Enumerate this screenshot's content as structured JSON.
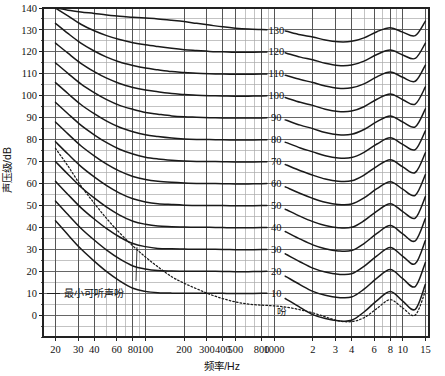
{
  "chart_data": {
    "type": "line",
    "title": "",
    "xlabel": "频率/Hz",
    "ylabel": "声压级/dB",
    "xscale": "log",
    "xlim": [
      16,
      16000
    ],
    "ylim": [
      -10,
      140
    ],
    "grid": true,
    "legend_position": "inline-labels",
    "x_tick_labels": [
      "20",
      "30",
      "40",
      "60",
      "80",
      "100",
      "200",
      "300",
      "400",
      "500",
      "800",
      "1000",
      "2",
      "3",
      "4",
      "6",
      "8",
      "10",
      "15"
    ],
    "x_tick_values": [
      20,
      30,
      40,
      60,
      80,
      100,
      200,
      300,
      400,
      500,
      800,
      1000,
      2000,
      3000,
      4000,
      6000,
      8000,
      10000,
      15000
    ],
    "y_tick_labels": [
      "0",
      "10",
      "20",
      "30",
      "40",
      "50",
      "60",
      "70",
      "80",
      "90",
      "100",
      "110",
      "120",
      "130",
      "140"
    ],
    "y_tick_values": [
      0,
      10,
      20,
      30,
      40,
      50,
      60,
      70,
      80,
      90,
      100,
      110,
      120,
      130,
      140
    ],
    "y_minor_step": 5,
    "annotations": [
      {
        "name": "minimum-audible-field",
        "text": "最小可听声吩",
        "x": 100,
        "y": 10
      },
      {
        "name": "phon-unit",
        "text": "吩",
        "x": 1150,
        "y": 2
      }
    ],
    "series_unit": "吩",
    "series_labels": [
      "130",
      "120",
      "110",
      "100",
      "90",
      "80",
      "70",
      "60",
      "50",
      "40",
      "30",
      "20",
      "10"
    ],
    "x": [
      20,
      25,
      31.5,
      40,
      50,
      63,
      80,
      100,
      125,
      160,
      200,
      250,
      315,
      400,
      500,
      630,
      800,
      1000,
      1250,
      1600,
      2000,
      2500,
      3150,
      4000,
      5000,
      6300,
      8000,
      10000,
      12500,
      15000
    ],
    "series": [
      {
        "name": "130 phon",
        "values": [
          140.0,
          139.0,
          138.2,
          137.5,
          136.8,
          136.2,
          135.8,
          135.4,
          135.0,
          134.4,
          133.8,
          133.0,
          132.2,
          131.4,
          130.8,
          130.4,
          130.2,
          130.0,
          129.4,
          127.8,
          126.8,
          125.4,
          124.6,
          124.8,
          126.4,
          129.2,
          131.0,
          129.0,
          127.4,
          134.0
        ]
      },
      {
        "name": "120 phon",
        "values": [
          140.0,
          136.4,
          132.6,
          129.6,
          127.4,
          125.6,
          124.2,
          123.2,
          122.4,
          121.6,
          121.0,
          120.6,
          120.2,
          120.0,
          119.8,
          119.8,
          119.9,
          120.0,
          119.4,
          117.6,
          116.4,
          114.8,
          113.8,
          114.0,
          115.8,
          118.8,
          120.8,
          118.6,
          117.0,
          124.0
        ]
      },
      {
        "name": "110 phon",
        "values": [
          133.0,
          128.4,
          124.0,
          120.4,
          117.6,
          115.4,
          113.8,
          112.6,
          111.8,
          111.0,
          110.6,
          110.2,
          110.0,
          109.9,
          109.8,
          109.8,
          109.9,
          110.0,
          109.2,
          107.4,
          106.0,
          104.4,
          103.4,
          103.6,
          105.4,
          108.6,
          110.8,
          108.4,
          106.6,
          114.0
        ]
      },
      {
        "name": "100 phon",
        "values": [
          124.0,
          119.4,
          114.8,
          111.0,
          108.0,
          105.6,
          103.8,
          102.6,
          101.8,
          101.0,
          100.6,
          100.2,
          100.0,
          99.9,
          99.8,
          99.8,
          99.9,
          100.0,
          99.0,
          97.0,
          95.6,
          93.8,
          92.8,
          93.0,
          95.0,
          98.4,
          100.8,
          98.2,
          96.2,
          104.0
        ]
      },
      {
        "name": "90 phon",
        "values": [
          115.0,
          110.2,
          105.4,
          101.4,
          98.2,
          95.6,
          93.8,
          92.4,
          91.6,
          90.8,
          90.4,
          90.2,
          90.0,
          89.9,
          89.8,
          89.8,
          89.9,
          90.0,
          88.8,
          86.6,
          85.0,
          83.2,
          82.2,
          82.4,
          84.6,
          88.2,
          90.8,
          88.0,
          85.8,
          94.0
        ]
      },
      {
        "name": "80 phon",
        "values": [
          106.0,
          101.0,
          96.0,
          91.8,
          88.4,
          85.6,
          83.6,
          82.2,
          81.4,
          80.7,
          80.3,
          80.1,
          80.0,
          79.9,
          79.8,
          79.8,
          79.9,
          80.0,
          78.6,
          76.2,
          74.4,
          72.6,
          71.6,
          71.8,
          74.2,
          78.0,
          80.8,
          77.8,
          75.4,
          84.0
        ]
      },
      {
        "name": "70 phon",
        "values": [
          97.0,
          91.8,
          86.6,
          82.2,
          78.6,
          75.6,
          73.4,
          72.0,
          71.2,
          70.6,
          70.2,
          70.0,
          70.0,
          69.9,
          69.8,
          69.8,
          69.9,
          70.0,
          68.4,
          65.8,
          63.8,
          62.0,
          61.0,
          61.2,
          63.8,
          67.8,
          70.8,
          67.6,
          65.0,
          74.0
        ]
      },
      {
        "name": "60 phon",
        "values": [
          88.0,
          82.6,
          77.2,
          72.6,
          68.8,
          65.6,
          63.2,
          61.8,
          61.0,
          60.5,
          60.2,
          60.0,
          60.0,
          59.9,
          59.8,
          59.8,
          59.9,
          60.0,
          58.2,
          55.4,
          53.2,
          51.4,
          50.4,
          50.6,
          53.4,
          57.6,
          60.8,
          57.4,
          54.6,
          64.0
        ]
      },
      {
        "name": "50 phon",
        "values": [
          79.0,
          73.4,
          67.8,
          63.0,
          59.0,
          55.6,
          53.0,
          51.6,
          50.8,
          50.4,
          50.1,
          50.0,
          50.0,
          49.9,
          49.8,
          49.8,
          49.9,
          50.0,
          48.0,
          45.0,
          42.6,
          40.8,
          39.8,
          40.0,
          43.0,
          47.4,
          50.8,
          47.2,
          44.2,
          54.0
        ]
      },
      {
        "name": "40 phon",
        "values": [
          70.0,
          64.2,
          58.4,
          53.4,
          49.2,
          45.6,
          42.8,
          41.4,
          40.6,
          40.3,
          40.1,
          40.0,
          40.0,
          39.9,
          39.8,
          39.8,
          39.9,
          40.0,
          37.8,
          34.6,
          32.0,
          30.2,
          29.2,
          29.4,
          32.6,
          37.2,
          40.8,
          37.0,
          33.8,
          44.0
        ]
      },
      {
        "name": "30 phon",
        "values": [
          61.0,
          55.0,
          49.0,
          43.8,
          39.4,
          35.6,
          32.6,
          31.2,
          30.4,
          30.2,
          30.1,
          30.0,
          30.0,
          29.9,
          29.8,
          29.8,
          29.9,
          30.0,
          27.6,
          24.2,
          21.4,
          19.6,
          18.6,
          18.8,
          22.2,
          27.0,
          30.8,
          26.8,
          23.4,
          34.0
        ]
      },
      {
        "name": "20 phon",
        "values": [
          52.0,
          45.8,
          39.6,
          34.2,
          29.6,
          25.6,
          22.4,
          21.0,
          20.3,
          20.1,
          20.0,
          20.0,
          20.0,
          19.9,
          19.8,
          19.8,
          19.9,
          20.0,
          17.4,
          13.8,
          10.8,
          9.0,
          8.0,
          8.2,
          11.8,
          16.8,
          20.8,
          16.6,
          13.0,
          24.0
        ]
      },
      {
        "name": "10 phon",
        "values": [
          43.0,
          36.6,
          30.2,
          24.6,
          19.8,
          15.6,
          12.2,
          10.8,
          10.2,
          10.0,
          10.0,
          10.0,
          10.0,
          9.9,
          9.8,
          9.8,
          9.9,
          10.0,
          7.2,
          3.4,
          0.2,
          -1.6,
          -2.6,
          -2.4,
          1.4,
          6.6,
          10.8,
          6.4,
          2.6,
          14.0
        ]
      },
      {
        "name": "threshold",
        "style": "dotted",
        "values": [
          76.0,
          68.0,
          59.0,
          51.0,
          44.0,
          37.5,
          31.5,
          26.5,
          22.0,
          17.5,
          14.5,
          12.0,
          9.5,
          7.5,
          6.0,
          5.0,
          4.5,
          4.2,
          3.6,
          2.4,
          1.0,
          -0.8,
          -2.6,
          -3.0,
          -1.2,
          3.0,
          7.0,
          3.2,
          0.0,
          11.0
        ]
      }
    ]
  },
  "axis": {
    "x_title": "频率/Hz",
    "y_title": "声压级/dB"
  },
  "colors": {
    "curve": "#1a1a1a",
    "grid_major": "#555555",
    "grid_minor": "#aaaaaa",
    "frame": "#222222",
    "background": "#ffffff"
  }
}
